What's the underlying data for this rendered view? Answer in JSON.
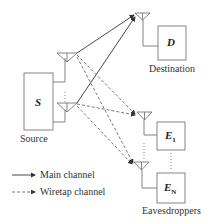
{
  "diagram": {
    "nodes": {
      "source": {
        "box_label": "S",
        "caption": "Source"
      },
      "destination": {
        "box_label": "D",
        "caption": "Destination"
      },
      "eavesdropper_1": {
        "box_label": "E",
        "subscript": "1"
      },
      "eavesdropper_n": {
        "box_label": "E",
        "subscript": "N"
      },
      "eavesdroppers_caption": "Eavesdroppers"
    },
    "legend": {
      "main": "Main channel",
      "wiretap": "Wiretap channel"
    },
    "colors": {
      "stroke": "#555555",
      "main_channel": "#333333",
      "wiretap_channel": "#555555"
    }
  }
}
